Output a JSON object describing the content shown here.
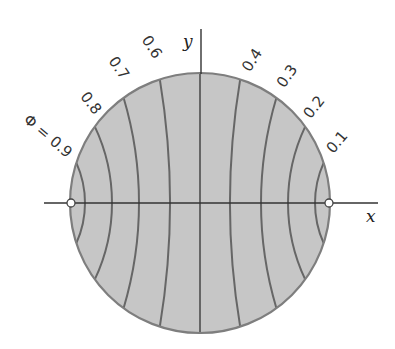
{
  "diagram": {
    "axes": {
      "x_label": "x",
      "y_label": "y"
    },
    "geometry": {
      "center": [
        200,
        203
      ],
      "radius": 130,
      "x_axis": [
        44,
        378
      ],
      "y_axis_top": 29,
      "nodes": [
        [
          71,
          203
        ],
        [
          329,
          203
        ]
      ]
    },
    "colors": {
      "disk_fill": "#c6c6c6",
      "disk_edge": "#7e7e7e",
      "equipotential": "#666666",
      "axis": "#333333",
      "node_fill": "#ffffff",
      "node_stroke": "#444444"
    },
    "equipotentials": [
      {
        "phi": 0.1,
        "label": "0.1",
        "x_crossing": 115,
        "label_pos": [
          337,
          142
        ],
        "label_rot": -50
      },
      {
        "phi": 0.2,
        "label": "0.2",
        "x_crossing": 88,
        "label_pos": [
          314,
          107
        ],
        "label_rot": -52
      },
      {
        "phi": 0.3,
        "label": "0.3",
        "x_crossing": 61,
        "label_pos": [
          287,
          76
        ],
        "label_rot": -55
      },
      {
        "phi": 0.4,
        "label": "0.4",
        "x_crossing": 30,
        "label_pos": [
          252,
          60
        ],
        "label_rot": -57
      },
      {
        "phi": 0.5,
        "label": "",
        "x_crossing": 0,
        "label_pos": null,
        "label_rot": 0
      },
      {
        "phi": 0.6,
        "label": "0.6",
        "x_crossing": -30,
        "label_pos": [
          152,
          47
        ],
        "label_rot": 57
      },
      {
        "phi": 0.7,
        "label": "0.7",
        "x_crossing": -61,
        "label_pos": [
          119,
          68
        ],
        "label_rot": 55
      },
      {
        "phi": 0.8,
        "label": "0.8",
        "x_crossing": -88,
        "label_pos": [
          91,
          103
        ],
        "label_rot": 52
      },
      {
        "phi": 0.9,
        "label": "Φ = 0.9",
        "x_crossing": -115,
        "label_pos": [
          48,
          136
        ],
        "label_rot": 40
      }
    ]
  }
}
